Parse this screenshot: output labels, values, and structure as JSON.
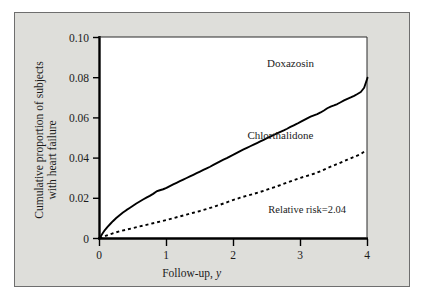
{
  "figure": {
    "background_color": "#dededa",
    "plot_background_color": "#ffffff",
    "border_color": "#6e6e6e",
    "axis_color": "#000000"
  },
  "chart_data": {
    "type": "line",
    "title": "",
    "subtitle": "",
    "xlabel": "Follow-up, y",
    "xlabel_plain": "Follow-up,",
    "xlabel_italic": "y",
    "ylabel": "Cumulative proportion of subjects with heart failure",
    "ylabel_line1": "Cumulative proportion of subjects",
    "ylabel_line2": "with heart failure",
    "xlim": [
      0,
      4
    ],
    "ylim": [
      0,
      0.1
    ],
    "grid": false,
    "legend_position": "inline-annotations",
    "xticks": [
      0,
      1,
      2,
      3,
      4
    ],
    "xtick_labels": [
      "0",
      "1",
      "2",
      "3",
      "4"
    ],
    "yticks": [
      0,
      0.02,
      0.04,
      0.06,
      0.08,
      0.1
    ],
    "ytick_labels": [
      "0",
      "0.02",
      "0.04",
      "0.06",
      "0.08",
      "0.10"
    ],
    "annotations": [
      {
        "name": "relative-risk",
        "text": "Relative risk=2.04",
        "x": 3.1,
        "y": 0.0125
      }
    ],
    "series": [
      {
        "name": "Doxazosin",
        "label": "Doxazosin",
        "style": "solid",
        "color": "#000000",
        "width": 1.9,
        "label_x": 2.85,
        "label_y": 0.0855,
        "x": [
          0.0,
          0.04,
          0.08,
          0.12,
          0.16,
          0.2,
          0.25,
          0.3,
          0.35,
          0.4,
          0.45,
          0.5,
          0.55,
          0.6,
          0.65,
          0.7,
          0.75,
          0.8,
          0.85,
          0.9,
          0.95,
          1.0,
          1.05,
          1.1,
          1.15,
          1.2,
          1.25,
          1.3,
          1.35,
          1.4,
          1.45,
          1.5,
          1.55,
          1.6,
          1.65,
          1.7,
          1.75,
          1.8,
          1.85,
          1.9,
          1.95,
          2.0,
          2.05,
          2.1,
          2.15,
          2.2,
          2.25,
          2.3,
          2.35,
          2.4,
          2.45,
          2.5,
          2.55,
          2.6,
          2.65,
          2.7,
          2.75,
          2.8,
          2.85,
          2.9,
          2.95,
          3.0,
          3.05,
          3.1,
          3.15,
          3.2,
          3.25,
          3.3,
          3.35,
          3.4,
          3.45,
          3.5,
          3.55,
          3.6,
          3.65,
          3.7,
          3.75,
          3.8,
          3.85,
          3.9,
          3.95,
          4.0
        ],
        "y": [
          0.0,
          0.0022,
          0.0042,
          0.0058,
          0.0072,
          0.0086,
          0.0102,
          0.0116,
          0.0129,
          0.0141,
          0.0152,
          0.0163,
          0.0174,
          0.0184,
          0.0194,
          0.0203,
          0.0212,
          0.0222,
          0.0234,
          0.024,
          0.0245,
          0.0252,
          0.0261,
          0.0269,
          0.0277,
          0.0285,
          0.0293,
          0.0301,
          0.0309,
          0.0317,
          0.0325,
          0.0333,
          0.0341,
          0.0349,
          0.0357,
          0.0366,
          0.0375,
          0.0384,
          0.0392,
          0.04,
          0.0409,
          0.0417,
          0.0426,
          0.0435,
          0.0443,
          0.0451,
          0.0459,
          0.0467,
          0.0475,
          0.0483,
          0.0491,
          0.0499,
          0.0507,
          0.0515,
          0.0523,
          0.0531,
          0.0538,
          0.0546,
          0.0555,
          0.0563,
          0.0571,
          0.058,
          0.0589,
          0.0598,
          0.0606,
          0.0613,
          0.0619,
          0.0627,
          0.0637,
          0.0648,
          0.0656,
          0.0662,
          0.0669,
          0.0678,
          0.0687,
          0.0695,
          0.0702,
          0.071,
          0.0719,
          0.0729,
          0.075,
          0.08
        ]
      },
      {
        "name": "Chlorthalidone",
        "label": "Chlorthalidone",
        "style": "dashed",
        "color": "#000000",
        "width": 1.9,
        "label_x": 2.7,
        "label_y": 0.0495,
        "x": [
          0.0,
          0.1,
          0.2,
          0.3,
          0.4,
          0.5,
          0.6,
          0.7,
          0.8,
          0.9,
          1.0,
          1.1,
          1.2,
          1.3,
          1.4,
          1.5,
          1.6,
          1.7,
          1.8,
          1.9,
          2.0,
          2.1,
          2.2,
          2.3,
          2.4,
          2.5,
          2.6,
          2.7,
          2.8,
          2.9,
          3.0,
          3.1,
          3.2,
          3.3,
          3.4,
          3.5,
          3.6,
          3.7,
          3.8,
          3.9,
          3.95
        ],
        "y": [
          0.0,
          0.0014,
          0.0026,
          0.0036,
          0.0044,
          0.0052,
          0.006,
          0.0068,
          0.0076,
          0.0084,
          0.0092,
          0.0101,
          0.011,
          0.0119,
          0.0128,
          0.0137,
          0.0147,
          0.0157,
          0.0168,
          0.018,
          0.0192,
          0.0203,
          0.0213,
          0.0222,
          0.0232,
          0.0243,
          0.0254,
          0.0266,
          0.0278,
          0.029,
          0.0302,
          0.0312,
          0.0322,
          0.0335,
          0.035,
          0.0364,
          0.0378,
          0.0392,
          0.0406,
          0.042,
          0.0432
        ]
      }
    ]
  }
}
